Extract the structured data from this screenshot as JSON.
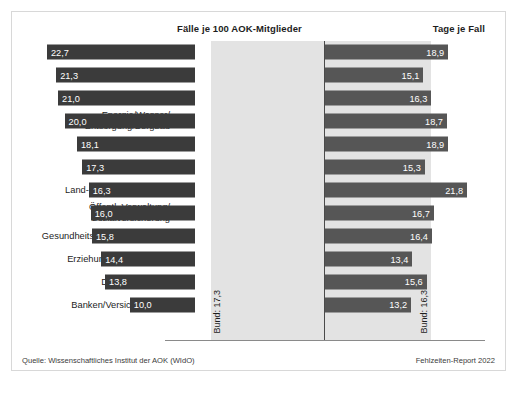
{
  "header": {
    "left_title": "Fälle je 100 AOK-Mitglieder",
    "right_title": "Tage je Fall"
  },
  "footer": {
    "source": "Quelle: Wissenschaftliches Institut der AOK (WIdO)",
    "report": "Fehlzeiten-Report 2022"
  },
  "reference": {
    "left_label": "Bund: 17,3",
    "right_label": "Bund: 16,3",
    "left_value": 17.3,
    "right_value": 16.3
  },
  "axis": {
    "ticks_left": [
      "25",
      "20",
      "15",
      "10",
      "5"
    ],
    "tick_zero": "0",
    "ticks_right": [
      "5",
      "10",
      "15",
      "20",
      "25"
    ],
    "max": 25,
    "step": 5
  },
  "colors": {
    "bar_left": "#3b3b3b",
    "bar_right": "#565656",
    "band": "#e3e3e3",
    "zero_line": "#4a4a4a",
    "panel_border": "#d8d8d8",
    "text": "#1d1d1d",
    "value_text": "#ffffff"
  },
  "chart_data": {
    "type": "bar",
    "title": "",
    "subtitle": "",
    "orientation": "horizontal",
    "layout": "diverging-butterfly",
    "xlabel": "",
    "ylabel": "",
    "xlim": [
      -25,
      25
    ],
    "grid": false,
    "legend": "none",
    "categories": [
      "Baugewerbe",
      "Metallindustrie",
      "Verarbeitendes Gewerbe",
      "Energie/Wasser/\nEntsorgung/Bergbau",
      "Verkehr/Transport",
      "Handel",
      "Land- und Forstwirtschaft",
      "Öffentl. Verwaltung/\nSozialversicherung",
      "Gesundheits- und Sozialwesen",
      "Erziehung und Unterricht",
      "Dienstleistungen",
      "Banken/Versicherungen"
    ],
    "series": [
      {
        "name": "Fälle je 100 AOK-Mitglieder",
        "side": "left",
        "values": [
          22.7,
          21.3,
          21.0,
          20.0,
          18.1,
          17.3,
          16.3,
          16.0,
          15.8,
          14.4,
          13.8,
          10.0
        ],
        "labels": [
          "22,7",
          "21,3",
          "21,0",
          "20,0",
          "18,1",
          "17,3",
          "16,3",
          "16,0",
          "15,8",
          "14,4",
          "13,8",
          "10,0"
        ]
      },
      {
        "name": "Tage je Fall",
        "side": "right",
        "values": [
          18.9,
          15.1,
          16.3,
          18.7,
          18.9,
          15.3,
          21.8,
          16.7,
          16.4,
          13.4,
          15.6,
          13.2
        ],
        "labels": [
          "18,9",
          "15,1",
          "16,3",
          "18,7",
          "18,9",
          "15,3",
          "21,8",
          "16,7",
          "16,4",
          "13,4",
          "15,6",
          "13,2"
        ]
      }
    ],
    "annotations": [
      {
        "text": "Bund: 17,3",
        "side": "left",
        "value": 17.3
      },
      {
        "text": "Bund: 16,3",
        "side": "right",
        "value": 16.3
      }
    ]
  }
}
